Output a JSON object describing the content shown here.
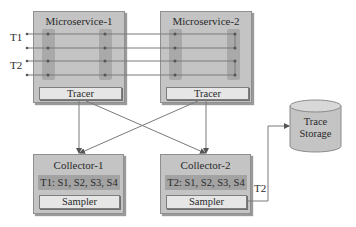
{
  "microservices": [
    {
      "title": "Microservice-1",
      "component": "Tracer"
    },
    {
      "title": "Microservice-2",
      "component": "Tracer"
    }
  ],
  "collectors": [
    {
      "title": "Collector-1",
      "trace_spans": "T1: S1, S2, S3, S4",
      "component": "Sampler"
    },
    {
      "title": "Collector-2",
      "trace_spans": "T2: S1, S2, S3, S4",
      "component": "Sampler"
    }
  ],
  "storage": {
    "line1": "Trace",
    "line2": "Storage"
  },
  "trace_labels": [
    "T1",
    "T2"
  ],
  "output_label": "T2",
  "colors": {
    "box": "#c4c4c4",
    "column": "#a9a9a9",
    "inner": "#e6e6e6",
    "line": "#7a7a7a"
  }
}
